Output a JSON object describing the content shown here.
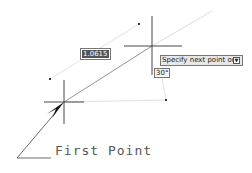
{
  "canvas": {
    "first_point": {
      "x": 64,
      "y": 102
    },
    "cursor_point": {
      "x": 152,
      "y": 46
    }
  },
  "dynamic_input": {
    "length_value": "1.0615",
    "prompt": "Specify next point or",
    "prompt_arrow_icon": "down-arrow-icon",
    "angle_value": "30°"
  },
  "annotation": {
    "label": "First Point"
  }
}
